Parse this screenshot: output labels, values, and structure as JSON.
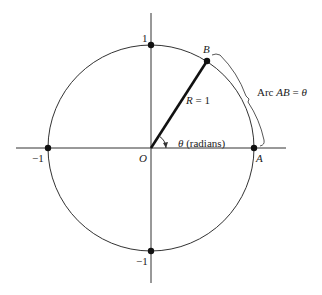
{
  "diagram": {
    "colors": {
      "stroke": "#333333",
      "radius": "#111111",
      "background": "#ffffff"
    },
    "center": {
      "x": 151,
      "y": 148
    },
    "radius_px": 103,
    "points": {
      "origin": {
        "label": "O"
      },
      "A": {
        "label": "A"
      },
      "B": {
        "label": "B"
      }
    },
    "axis_ticks": {
      "top": "1",
      "bottom": "−1",
      "left": "−1"
    },
    "radius_label": {
      "var": "R",
      "eq": " = 1"
    },
    "angle_label": {
      "var": "θ",
      "text": " (radians)"
    },
    "arc_label": {
      "prefix": "Arc ",
      "var": "AB",
      "eq": " = ",
      "theta": "θ"
    }
  }
}
